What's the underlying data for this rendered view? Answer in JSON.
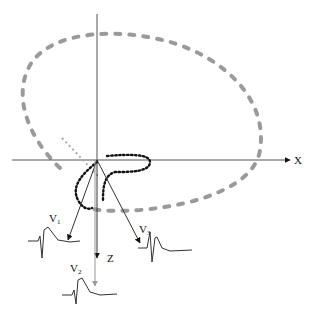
{
  "diagram": {
    "type": "vectorcardiogram-loops",
    "axes": {
      "x_label": "X",
      "z_label": "Z"
    },
    "leads": [
      {
        "name": "V",
        "sub": "1"
      },
      {
        "name": "V",
        "sub": "2"
      },
      {
        "name": "V",
        "sub": "3"
      }
    ],
    "colors": {
      "axis": "#555555",
      "large_loop": "#9a9a9a",
      "small_loop": "#111111",
      "lead_vector": "#333333",
      "v2_vector": "#9a9a9a"
    }
  }
}
